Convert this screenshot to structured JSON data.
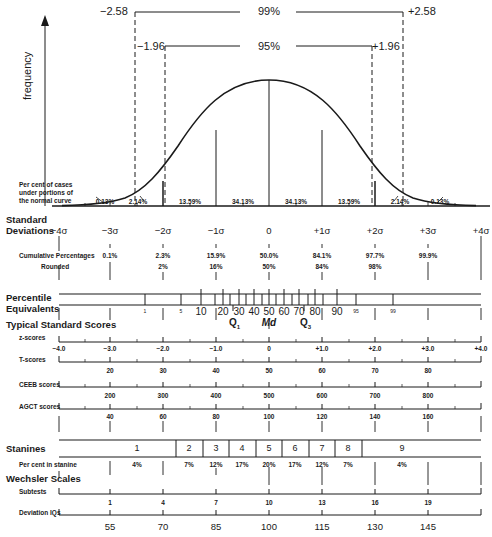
{
  "y_axis_label": "frequency",
  "confidence": {
    "outer": {
      "left": "−2.58",
      "label": "99%",
      "right": "+2.58"
    },
    "inner": {
      "left": "−1.96",
      "label": "95%",
      "right": "+1.96"
    }
  },
  "curve_note": [
    "Per cent of cases",
    "under portions of",
    "the normal curve"
  ],
  "area_percentages": [
    "0.13%",
    "2.14%",
    "13.59%",
    "34.13%",
    "34.13%",
    "13.59%",
    "2.14%",
    "0.13%"
  ],
  "std_dev": {
    "label": [
      "Standard",
      "Deviations"
    ],
    "ticks": [
      "−4σ",
      "−3σ",
      "−2σ",
      "−1σ",
      "0",
      "+1σ",
      "+2σ",
      "+3σ",
      "+4σ"
    ]
  },
  "cumulative": {
    "label": "Cumulative Percentages",
    "rounded_label": "Rounded",
    "values": [
      "0.1%",
      "2.3%",
      "15.9%",
      "50.0%",
      "84.1%",
      "97.7%",
      "99.9%"
    ],
    "rounded": [
      "2%",
      "16%",
      "50%",
      "84%",
      "98%"
    ]
  },
  "percentile": {
    "label": [
      "Percentile",
      "Equivalents"
    ],
    "ticks": [
      "1",
      "5",
      "10",
      "20",
      "30",
      "40",
      "50",
      "60",
      "70",
      "80",
      "90",
      "95",
      "99"
    ],
    "markers": {
      "q1": "Q",
      "q1_sub": "1",
      "md": "Md",
      "q3": "Q",
      "q3_sub": "3"
    }
  },
  "standard_scores": {
    "heading": "Typical Standard Scores",
    "z": {
      "label": "z-scores",
      "values": [
        "−4.0",
        "−3.0",
        "−2.0",
        "−1.0",
        "0",
        "+1.0",
        "+2.0",
        "+3.0",
        "+4.0"
      ]
    },
    "t": {
      "label": "T-scores",
      "values": [
        "20",
        "30",
        "40",
        "50",
        "60",
        "70",
        "80"
      ]
    },
    "ceeb": {
      "label": "CEEB scores",
      "values": [
        "200",
        "300",
        "400",
        "500",
        "600",
        "700",
        "800"
      ]
    },
    "agct": {
      "label": "AGCT scores",
      "values": [
        "40",
        "60",
        "80",
        "100",
        "120",
        "140",
        "160"
      ]
    }
  },
  "stanines": {
    "label": "Stanines",
    "values": [
      "1",
      "2",
      "3",
      "4",
      "5",
      "6",
      "7",
      "8",
      "9"
    ],
    "percent_label": "Per cent in stanine",
    "percents": [
      "4%",
      "7%",
      "12%",
      "17%",
      "20%",
      "17%",
      "12%",
      "7%",
      "4%"
    ]
  },
  "wechsler": {
    "heading": "Wechsler Scales",
    "subtests": {
      "label": "Subtests",
      "values": [
        "1",
        "4",
        "7",
        "10",
        "13",
        "16",
        "19"
      ]
    },
    "deviation_iq": {
      "label": "Deviation IQs",
      "values": [
        "55",
        "70",
        "85",
        "100",
        "115",
        "130",
        "145"
      ]
    }
  },
  "colors": {
    "ink": "#1a1a1a",
    "background": "#ffffff"
  }
}
